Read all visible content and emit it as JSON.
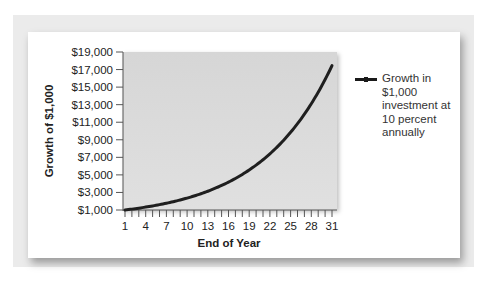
{
  "chart_data": {
    "type": "line",
    "title": "",
    "xlabel": "End of Year",
    "ylabel": "Growth of $1,000",
    "x_tick_labels": [
      "1",
      "4",
      "7",
      "10",
      "13",
      "16",
      "19",
      "22",
      "25",
      "28",
      "31"
    ],
    "y_tick_labels": [
      "$19,000",
      "$17,000",
      "$15,000",
      "$13,000",
      "$11,000",
      "$9,000",
      "$7,000",
      "$5,000",
      "$3,000",
      "$1,000"
    ],
    "xlim": [
      1,
      31
    ],
    "ylim": [
      1000,
      19000
    ],
    "grid": false,
    "legend_position": "right",
    "series": [
      {
        "name": "Growth in $1,000 investment at 10 percent annually",
        "x": [
          1,
          4,
          7,
          10,
          13,
          16,
          19,
          22,
          25,
          28,
          31
        ],
        "values": [
          1000,
          1331,
          1772,
          2358,
          3138,
          4177,
          5560,
          7400,
          9850,
          13110,
          17449
        ]
      }
    ]
  },
  "axes": {
    "y_title": "Growth of $1,000",
    "x_title": "End of Year"
  },
  "legend": {
    "label": "Growth in\n$1,000\ninvestment at\n10 percent\nannually",
    "line_color": "#1a1a1a"
  },
  "colors": {
    "plot_bg": "#d8d8d8",
    "curve": "#1f1f1f",
    "frame": "#ebebeb"
  }
}
